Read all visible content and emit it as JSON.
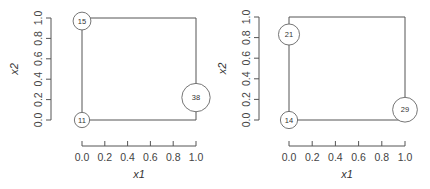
{
  "chart_data": [
    {
      "type": "scatter",
      "title": "",
      "xlabel": "x1",
      "ylabel": "x2",
      "xlim": [
        0,
        1
      ],
      "ylim": [
        0,
        1
      ],
      "x_ticks": [
        "0.0",
        "0.2",
        "0.4",
        "0.6",
        "0.8",
        "1.0"
      ],
      "y_ticks": [
        "0.0",
        "0.2",
        "0.4",
        "0.6",
        "0.8",
        "1.0"
      ],
      "grid": false,
      "legend": null,
      "frame": "polygon connecting corners (0,0)-(1,0)-(1,1)-(0,1)",
      "points": [
        {
          "x": 0.0,
          "y": 0.97,
          "label": "15",
          "size": 15
        },
        {
          "x": 0.0,
          "y": 0.0,
          "label": "11",
          "size": 11
        },
        {
          "x": 1.0,
          "y": 0.22,
          "label": "38",
          "size": 38
        }
      ]
    },
    {
      "type": "scatter",
      "title": "",
      "xlabel": "x1",
      "ylabel": "x2",
      "xlim": [
        0,
        1
      ],
      "ylim": [
        0,
        1
      ],
      "x_ticks": [
        "0.0",
        "0.2",
        "0.4",
        "0.6",
        "0.8",
        "1.0"
      ],
      "y_ticks": [
        "0.0",
        "0.2",
        "0.4",
        "0.6",
        "0.8",
        "1.0"
      ],
      "grid": false,
      "legend": null,
      "frame": "polygon connecting corners (0,0)-(1,0)-(1,1)-(0,1)",
      "points": [
        {
          "x": 0.0,
          "y": 0.83,
          "label": "21",
          "size": 21
        },
        {
          "x": 0.0,
          "y": 0.0,
          "label": "14",
          "size": 14
        },
        {
          "x": 1.0,
          "y": 0.1,
          "label": "29",
          "size": 29
        }
      ]
    }
  ],
  "colors": {
    "axis": "#555555",
    "text": "#444444",
    "node_stroke": "#666666",
    "background": "#ffffff"
  }
}
